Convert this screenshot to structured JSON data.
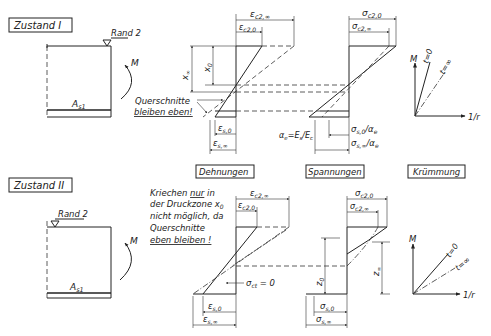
{
  "diagram": {
    "state1": {
      "title": "Zustand I",
      "edge_label": "Rand 2",
      "moment_label": "M",
      "steel_label": "A",
      "steel_sub": "s1",
      "note_line1": "Querschnitte",
      "note_line2": "bleiben eben!",
      "x_inf": "x",
      "x_inf_sub": "∞",
      "x_0": "x",
      "x_0_sub": "0",
      "strain": {
        "ec2_inf": "ε",
        "ec2_inf_sub": "c2,∞",
        "ec2_0": "ε",
        "ec2_0_sub": "c2,0",
        "es_0": "ε",
        "es_0_sub": "s,0",
        "es_inf": "ε",
        "es_inf_sub": "s,∞"
      },
      "stress": {
        "sc2_0": "σ",
        "sc2_0_sub": "c2,0",
        "sc2_inf": "σ",
        "sc2_inf_sub": "c2,∞",
        "ss0_ae": "σ",
        "ss0_ae_sub": "s,0",
        "ss0_ae_tail": "/α",
        "ss0_ae_tail_sub": "e",
        "ssinf_ae": "σ",
        "ssinf_ae_sub": "s,∞",
        "ssinf_ae_tail": "/α",
        "ssinf_ae_tail_sub": "e",
        "alpha_eq": "α",
        "alpha_eq_sub": "e",
        "alpha_eq_rest": "=E",
        "alpha_eq_rest_sub": "s",
        "alpha_eq_div": "/E",
        "alpha_eq_div_sub": "c"
      },
      "curvature": {
        "axis_y": "M",
        "axis_x": "1/r",
        "line_t0": "t=0",
        "line_tinf": "t=∞"
      }
    },
    "column_headers": {
      "strain": "Dehnungen",
      "stress": "Spannungen",
      "curvature": "Krümmung"
    },
    "state2": {
      "title": "Zustand II",
      "edge_label": "Rand 2",
      "moment_label": "M",
      "steel_label": "A",
      "steel_sub": "s1",
      "note_lines": [
        "Kriechen ",
        "nur",
        " in",
        "der Druckzone x",
        "0",
        "nicht möglich, da",
        "Querschnitte",
        "eben bleiben !"
      ],
      "strain": {
        "ec2_inf": "ε",
        "ec2_inf_sub": "c2,∞",
        "ec2_0": "ε",
        "ec2_0_sub": "c2,0",
        "sct": "σ",
        "sct_sub": "ct",
        "sct_rest": " = 0",
        "es_0": "ε",
        "es_0_sub": "s,0",
        "es_inf": "ε",
        "es_inf_sub": "s,∞"
      },
      "stress": {
        "sc2_0": "σ",
        "sc2_0_sub": "c2,0",
        "sc2_inf": "σ",
        "sc2_inf_sub": "c2,∞",
        "z_0": "z",
        "z_0_sub": "0",
        "z_inf": "z",
        "z_inf_sub": "∞",
        "ss_0": "σ",
        "ss_0_sub": "s,0",
        "ss_inf": "σ",
        "ss_inf_sub": "s,∞"
      },
      "curvature": {
        "axis_y": "M",
        "axis_x": "1/r",
        "line_t0": "t=0",
        "line_tinf": "t=∞"
      }
    }
  }
}
